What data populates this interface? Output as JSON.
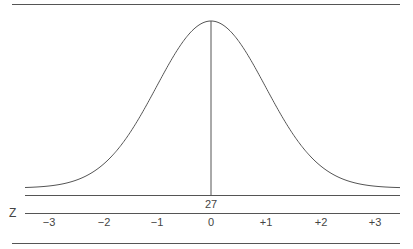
{
  "chart_data": {
    "type": "line",
    "title": "",
    "mean_label": "27",
    "axis_label": "Z",
    "x": [
      -3,
      -2,
      -1,
      0,
      1,
      2,
      3
    ],
    "tick_labels": [
      "−3",
      "−2",
      "−1",
      "0",
      "+1",
      "+2",
      "+3"
    ],
    "curve": "normal",
    "mu": 0,
    "sigma": 1,
    "xlim": [
      -3.4,
      3.4
    ],
    "grid": false,
    "legend": null
  },
  "labels": {
    "mean": "27",
    "z_axis": "Z",
    "ticks": [
      "−3",
      "−2",
      "−1",
      "0",
      "+1",
      "+2",
      "+3"
    ]
  },
  "colors": {
    "line": "#555555",
    "text": "#444444"
  }
}
